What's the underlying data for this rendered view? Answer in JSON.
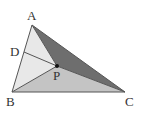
{
  "diagram": {
    "type": "geometry",
    "points": {
      "A": {
        "label": "A",
        "x": 32,
        "y": 25
      },
      "B": {
        "label": "B",
        "x": 12,
        "y": 92
      },
      "C": {
        "label": "C",
        "x": 125,
        "y": 92
      },
      "D": {
        "label": "D",
        "x": 24,
        "y": 52
      },
      "P": {
        "label": "P",
        "x": 57,
        "y": 66
      }
    },
    "regions": {
      "APC": {
        "fill": "#6e6e6e"
      },
      "BPC": {
        "fill": "#c4c4c4"
      },
      "ABP": {
        "fill": "#e8e8e8"
      }
    },
    "segments": [
      "AB",
      "BC",
      "CA",
      "AP",
      "BP",
      "CP",
      "DP"
    ],
    "labels": {
      "A": "A",
      "B": "B",
      "C": "C",
      "D": "D",
      "P": "P"
    }
  }
}
